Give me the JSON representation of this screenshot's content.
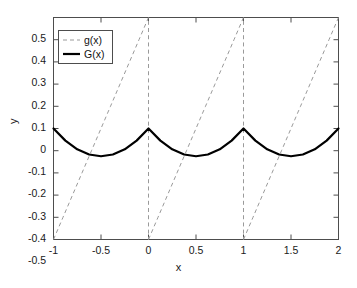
{
  "chart_data": {
    "type": "line",
    "title": "",
    "xlabel": "x",
    "ylabel": "y",
    "xlim": [
      -1,
      2
    ],
    "ylim": [
      -0.5,
      0.5
    ],
    "xticks": [
      -1,
      -0.5,
      0,
      0.5,
      1,
      1.5,
      2
    ],
    "xticklabels": [
      "-1",
      "-0.5",
      "0",
      "0.5",
      "1",
      "1.5",
      "2"
    ],
    "yticks": [
      -0.5,
      -0.4,
      -0.3,
      -0.2,
      -0.1,
      0,
      0.1,
      0.2,
      0.3,
      0.4,
      0.5
    ],
    "yticklabels": [
      "-0.5",
      "-0.4",
      "-0.3",
      "-0.2",
      "-0.1",
      "0",
      "0.1",
      "0.2",
      "0.3",
      "0.4",
      "0.5"
    ],
    "grid": false,
    "legend_position": "upper left",
    "series": [
      {
        "name": "g(x)",
        "style": "dashed",
        "color": "#9a9a9a",
        "width": 1,
        "description": "sawtooth: g(x) = x - floor(x) - 0.5, sawtooth ramp from -0.5 to 0.5 on each unit interval with vertical jumps at integers",
        "x": [
          -1,
          -0.9,
          -0.8,
          -0.7,
          -0.6,
          -0.5,
          -0.4,
          -0.3,
          -0.2,
          -0.1,
          0,
          0.1,
          0.2,
          0.3,
          0.4,
          0.5,
          0.6,
          0.7,
          0.8,
          0.9,
          1,
          1.1,
          1.2,
          1.3,
          1.4,
          1.5,
          1.6,
          1.7,
          1.8,
          1.9,
          2
        ],
        "values": [
          -0.5,
          -0.4,
          -0.3,
          -0.2,
          -0.1,
          0,
          0.1,
          0.2,
          0.3,
          0.4,
          0.5,
          -0.4,
          -0.3,
          -0.2,
          -0.1,
          0,
          0.1,
          0.2,
          0.3,
          0.4,
          0.5,
          -0.4,
          -0.3,
          -0.2,
          -0.1,
          0,
          0.1,
          0.2,
          0.3,
          0.4,
          0.5
        ]
      },
      {
        "name": "G(x)",
        "style": "solid",
        "color": "#000000",
        "width": 2.2,
        "description": "periodic parabola: G(x) = 0.5*((x-floor(x))^2 - (x-floor(x))), zero at integers, minimum -0.125 at half-integers",
        "x": [
          -1,
          -0.875,
          -0.75,
          -0.625,
          -0.5,
          -0.375,
          -0.25,
          -0.125,
          0,
          0.125,
          0.25,
          0.375,
          0.5,
          0.625,
          0.75,
          0.875,
          1,
          1.125,
          1.25,
          1.375,
          1.5,
          1.625,
          1.75,
          1.875,
          2
        ],
        "values": [
          0,
          -0.0547,
          -0.0938,
          -0.1172,
          -0.125,
          -0.1172,
          -0.0938,
          -0.0547,
          0,
          -0.0547,
          -0.0938,
          -0.1172,
          -0.125,
          -0.1172,
          -0.0938,
          -0.0547,
          0,
          -0.0547,
          -0.0938,
          -0.1172,
          -0.125,
          -0.1172,
          -0.0938,
          -0.0547,
          0
        ]
      }
    ],
    "legend": [
      {
        "label": "g(x)",
        "style": "dashed",
        "color": "#9a9a9a"
      },
      {
        "label": "G(x)",
        "style": "solid",
        "color": "#000000"
      }
    ],
    "colors": {
      "axis": "#4d4d4d",
      "text": "#1a1a1a",
      "background": "#ffffff",
      "g_line": "#9a9a9a",
      "G_line": "#000000"
    }
  }
}
